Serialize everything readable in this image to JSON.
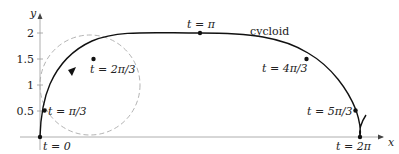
{
  "axes": {
    "x_label": "x",
    "y_label": "y",
    "y_ticks": [
      "0.5",
      "1",
      "1.5",
      "2"
    ]
  },
  "curve": {
    "name": "cycloid",
    "label": "cycloid"
  },
  "points": [
    {
      "t": "0",
      "label": "t = 0"
    },
    {
      "t": "π/3",
      "label": "t = π/3"
    },
    {
      "t": "2π/3",
      "label": "t = 2π/3"
    },
    {
      "t": "π",
      "label": "t = π"
    },
    {
      "t": "4π/3",
      "label": "t = 4π/3"
    },
    {
      "t": "5π/3",
      "label": "t = 5π/3"
    },
    {
      "t": "2π",
      "label": "t = 2π"
    }
  ],
  "circle": {
    "style": "dashed",
    "color": "#aaaaaa"
  }
}
